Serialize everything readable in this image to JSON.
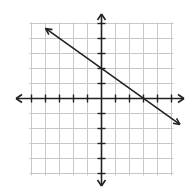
{
  "chart_data": {
    "type": "line",
    "title": "",
    "xlabel": "",
    "ylabel": "",
    "xlim": [
      -5,
      5
    ],
    "ylim": [
      -5,
      5
    ],
    "grid": true,
    "axis_arrows": true,
    "tick_labels": false,
    "series": [
      {
        "name": "line",
        "equation": "y = -2/3 x + 2",
        "slope": -0.6667,
        "y_intercept": 2,
        "x_intercept": 3,
        "arrows_both_ends": true,
        "x": [
          -4,
          5.6
        ],
        "y": [
          4.67,
          -1.73
        ]
      }
    ]
  },
  "colors": {
    "grid": "#c8c8c8",
    "axis": "#222222",
    "line": "#222222",
    "background": "#ffffff"
  }
}
